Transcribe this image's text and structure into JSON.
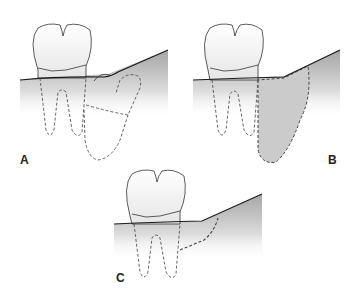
{
  "figure": {
    "panels": [
      {
        "id": "A",
        "label": "A",
        "description": "Molar with impacted tooth crown outline (dashed) in bone distal to roots"
      },
      {
        "id": "B",
        "label": "B",
        "description": "Molar with shaded dashed region of bone distal to roots"
      },
      {
        "id": "C",
        "label": "C",
        "description": "Molar with dashed line marking bone distal to roots"
      }
    ],
    "colors": {
      "outline": "#333333",
      "gum_line": "#1a1a1a",
      "bone_shade_dark": "#9a9a9a",
      "bone_shade_light": "#ffffff",
      "defect_fill": "#c8c8c8",
      "dashed": "#555555"
    }
  }
}
